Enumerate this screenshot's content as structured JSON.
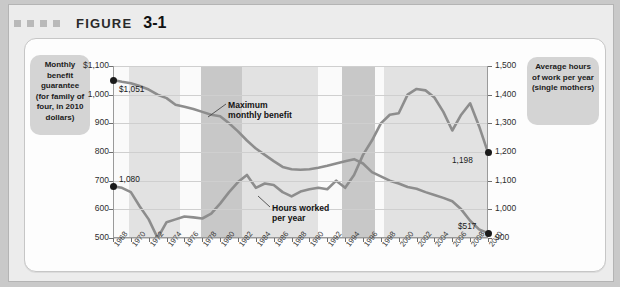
{
  "figure": {
    "label": "FIGURE",
    "number": "3-1",
    "square_count": 4
  },
  "callouts": {
    "left": "Monthly benefit guarantee (for family of four, in 2010 dollars)",
    "right": "Average hours of work per year (single mothers)"
  },
  "colors": {
    "series_line": "#8d8d8d",
    "band_light": "#e2e2e2",
    "band_dark": "#c8c8c8",
    "callout_bg": "#d4d4d4",
    "panel_bg": "#fdfdfd",
    "frame_bg": "#ececec",
    "page_bg": "#c9c9c9",
    "endpoint_dot": "#1a1a1a"
  },
  "chart_data": {
    "type": "line",
    "title": "",
    "xlabel": "",
    "grid": true,
    "legend": "annotations",
    "x": [
      1968,
      1969,
      1970,
      1971,
      1972,
      1973,
      1974,
      1975,
      1976,
      1977,
      1978,
      1979,
      1980,
      1981,
      1982,
      1983,
      1984,
      1985,
      1986,
      1987,
      1988,
      1989,
      1990,
      1991,
      1992,
      1993,
      1994,
      1995,
      1996,
      1997,
      1998,
      1999,
      2000,
      2001,
      2002,
      2003,
      2004,
      2005,
      2006,
      2007,
      2008,
      2009,
      2010
    ],
    "x_tick_labels": [
      "1968",
      "1970",
      "1972",
      "1974",
      "1976",
      "1978",
      "1980",
      "1982",
      "1984",
      "1986",
      "1988",
      "1990",
      "1992",
      "1994",
      "1996",
      "1998",
      "2000",
      "2002",
      "2004",
      "2006",
      "2008",
      "2010"
    ],
    "axes": {
      "left": {
        "label": "Monthly benefit guarantee (for family of four, in 2010 dollars)",
        "ylim": [
          500,
          1100
        ],
        "ticks": [
          1100,
          1000,
          900,
          800,
          700,
          600,
          500
        ],
        "tick_labels": [
          "$1,100",
          "1,000",
          "900",
          "800",
          "700",
          "600",
          "500"
        ]
      },
      "right": {
        "label": "Average hours of work per year (single mothers)",
        "ylim": [
          900,
          1500
        ],
        "ticks": [
          1500,
          1400,
          1300,
          1200,
          1100,
          1000,
          900
        ],
        "tick_labels": [
          "1,500",
          "1,400",
          "1,300",
          "1,200",
          "1,100",
          "1,000",
          "900"
        ]
      }
    },
    "series": [
      {
        "name": "Maximum monthly benefit",
        "axis": "left",
        "annotation": "Maximum monthly benefit",
        "start_label": "$1,051",
        "end_label": "$517",
        "values": [
          1051,
          1045,
          1040,
          1030,
          1018,
          1000,
          988,
          965,
          958,
          950,
          940,
          930,
          925,
          900,
          872,
          840,
          812,
          790,
          768,
          748,
          740,
          738,
          740,
          745,
          752,
          760,
          768,
          775,
          760,
          730,
          715,
          700,
          690,
          678,
          672,
          660,
          650,
          640,
          628,
          600,
          560,
          530,
          517
        ]
      },
      {
        "name": "Hours worked per year",
        "axis": "right",
        "annotation": "Hours worked per year",
        "start_label": "1,080",
        "end_label": "1,198",
        "values": [
          1080,
          1075,
          1060,
          1010,
          965,
          900,
          955,
          965,
          975,
          972,
          968,
          985,
          1020,
          1060,
          1095,
          1120,
          1075,
          1090,
          1085,
          1060,
          1045,
          1062,
          1070,
          1075,
          1070,
          1100,
          1075,
          1120,
          1190,
          1240,
          1300,
          1330,
          1335,
          1400,
          1420,
          1415,
          1390,
          1340,
          1275,
          1330,
          1370,
          1290,
          1198
        ]
      }
    ],
    "shaded_bands": [
      {
        "start": 1969.8,
        "end": 1975.5,
        "shade": "light"
      },
      {
        "start": 1977.8,
        "end": 1982.5,
        "shade": "dark"
      },
      {
        "start": 1982.5,
        "end": 1991.0,
        "shade": "light"
      },
      {
        "start": 1993.6,
        "end": 1997.4,
        "shade": "dark"
      },
      {
        "start": 1998.3,
        "end": 2010.0,
        "shade": "light"
      }
    ]
  }
}
